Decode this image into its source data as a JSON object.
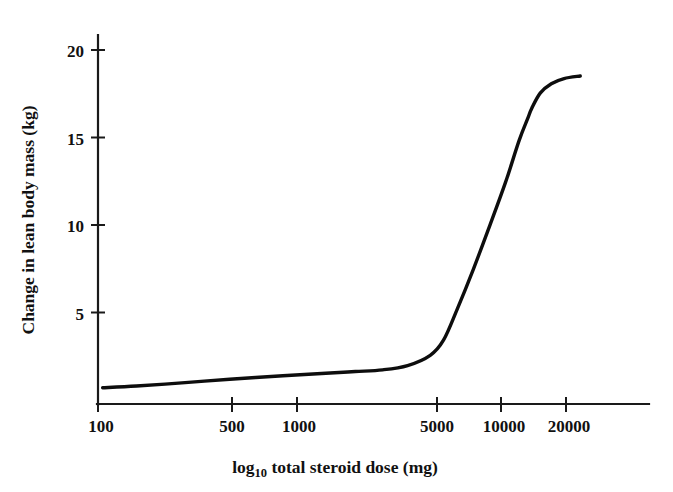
{
  "chart_data": {
    "type": "line",
    "title": "",
    "subtitle": "",
    "xlabel": "log10 total steroid dose (mg)",
    "xlabel_parts": {
      "pre": "log",
      "sub": "10",
      "post": " total steroid dose (mg)"
    },
    "ylabel": "Change in lean body mass (kg)",
    "xscale": "log",
    "yscale": "linear",
    "xlim": [
      100,
      33000
    ],
    "ylim": [
      0,
      21.6
    ],
    "xticks": [
      100,
      500,
      1000,
      5000,
      10000,
      20000
    ],
    "xtick_labels": [
      "100",
      "500",
      "1000",
      "5000",
      "10000",
      "20000"
    ],
    "yticks": [
      5,
      10,
      15,
      20
    ],
    "ytick_labels": [
      "5",
      "10",
      "15",
      "20"
    ],
    "grid": false,
    "legend": null,
    "annotations": [],
    "series": [
      {
        "name": "Change in lean body mass",
        "color": "#0d0d0d",
        "linewidth": 3.4,
        "x": [
          105,
          150,
          250,
          400,
          700,
          1100,
          1500,
          2000,
          2600,
          3300,
          3800,
          4400,
          5200,
          6200,
          7300,
          8400,
          9200,
          9600,
          10500,
          11800,
          13500,
          16000
        ],
        "y": [
          0.95,
          1.05,
          1.25,
          1.45,
          1.65,
          1.8,
          1.9,
          2.0,
          2.25,
          2.85,
          3.75,
          5.6,
          7.9,
          10.5,
          13.0,
          15.4,
          16.7,
          17.3,
          18.2,
          18.75,
          19.05,
          19.2
        ]
      }
    ]
  },
  "axes": {
    "x_axis_name": "x-axis",
    "y_axis_name": "y-axis"
  }
}
